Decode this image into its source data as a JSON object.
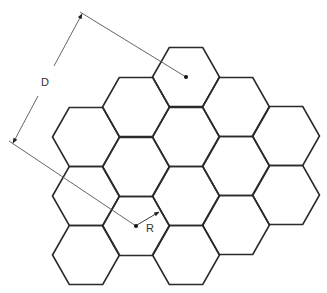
{
  "diagram": {
    "type": "hexagonal-cell-grid",
    "hex_radius": 33.5,
    "hex_half_height": 29.5,
    "cells": [
      {
        "cx": 86,
        "cy": 137
      },
      {
        "cx": 86,
        "cy": 196
      },
      {
        "cx": 86,
        "cy": 255
      },
      {
        "cx": 136,
        "cy": 107
      },
      {
        "cx": 136,
        "cy": 167
      },
      {
        "cx": 136,
        "cy": 226
      },
      {
        "cx": 186,
        "cy": 77
      },
      {
        "cx": 186,
        "cy": 137
      },
      {
        "cx": 186,
        "cy": 196
      },
      {
        "cx": 186,
        "cy": 255
      },
      {
        "cx": 236,
        "cy": 107
      },
      {
        "cx": 236,
        "cy": 166
      },
      {
        "cx": 236,
        "cy": 225
      },
      {
        "cx": 286,
        "cy": 136
      },
      {
        "cx": 286,
        "cy": 195
      }
    ],
    "points": [
      {
        "name": "cell-center-top",
        "x": 186,
        "y": 77
      },
      {
        "name": "cell-center-R",
        "x": 136,
        "y": 226
      }
    ],
    "labels": {
      "distance": "D",
      "radius": "R"
    },
    "colors": {
      "hex_stroke": "#2a2a2a",
      "dimension_stroke": "#555555",
      "background": "#ffffff"
    }
  }
}
